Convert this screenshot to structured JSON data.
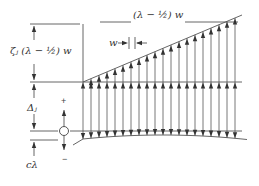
{
  "labels": {
    "top_span": "(λ − ½) w",
    "spacing": "w",
    "zeta_height": "ζⱼ (λ − ½) w",
    "delta": "Δⱼ",
    "c_lambda": "cλ",
    "plus": "+",
    "minus": "−"
  },
  "geometry": {
    "left_x": 83,
    "right_x": 242,
    "arrow_spacing": 8,
    "top_baseline_y": 82,
    "slope_top_y": 15,
    "bottom_line_y": 131,
    "circle": {
      "cx": 64,
      "cy": 131,
      "r": 4.5
    }
  },
  "colors": {
    "line": "#555555",
    "arrow": "#333333"
  }
}
